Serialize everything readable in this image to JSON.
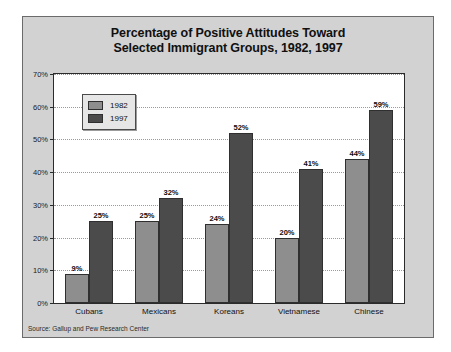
{
  "figure": {
    "title_line1": "Percentage of Positive Attitudes Toward",
    "title_line2": "Selected Immigrant Groups, 1982, 1997",
    "source_note": "Source: Gallup and Pew Research Center",
    "background_color": "#d2d2d2",
    "plot_background_color": "#ffffff",
    "frame_color": "#6b6b6b"
  },
  "legend": {
    "position": "top-left-inside-plot",
    "entries": [
      {
        "label": "1982",
        "color": "#8e8e8e"
      },
      {
        "label": "1997",
        "color": "#4b4b4b"
      }
    ]
  },
  "chart_data": {
    "type": "bar",
    "title": "Percentage of Positive Attitudes Toward Selected Immigrant Groups, 1982, 1997",
    "subtitle": "",
    "xlabel": "",
    "ylabel": "",
    "categories": [
      "Cubans",
      "Mexicans",
      "Koreans",
      "Vietnamese",
      "Chinese"
    ],
    "series": [
      {
        "name": "1982",
        "color": "#8e8e8e",
        "values": [
          9,
          25,
          24,
          20,
          44
        ],
        "value_labels": [
          "9%",
          "25%",
          "24%",
          "20%",
          "44%"
        ]
      },
      {
        "name": "1997",
        "color": "#4b4b4b",
        "values": [
          25,
          32,
          52,
          41,
          59
        ],
        "value_labels": [
          "25%",
          "32%",
          "52%",
          "41%",
          "59%"
        ]
      }
    ],
    "ylim": [
      0,
      70
    ],
    "ytick_values": [
      0,
      10,
      20,
      30,
      40,
      50,
      60,
      70
    ],
    "ytick_labels": [
      "0%",
      "10%",
      "20%",
      "30%",
      "40%",
      "50%",
      "60%",
      "70%"
    ],
    "grid": true,
    "grid_style": "dotted-horizontal",
    "legend_position": "upper left",
    "annotations": [
      "Source: Gallup and Pew Research Center"
    ]
  }
}
